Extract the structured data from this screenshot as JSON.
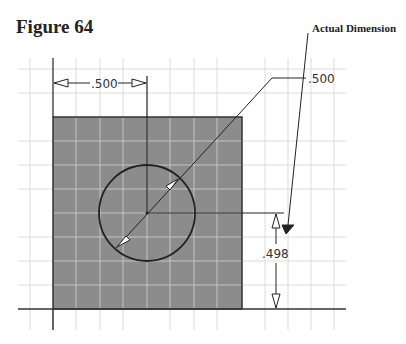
{
  "figure": {
    "title": "Figure 64",
    "callout_label": "Actual Dimension"
  },
  "dimensions": {
    "horizontal": ".500",
    "diameter": ".500",
    "vertical": ".498"
  },
  "colors": {
    "part_fill": "#8c8c8c",
    "grid_line": "#d8d8d8",
    "grid_on_part": "#c8c8c8",
    "line": "#222222"
  }
}
